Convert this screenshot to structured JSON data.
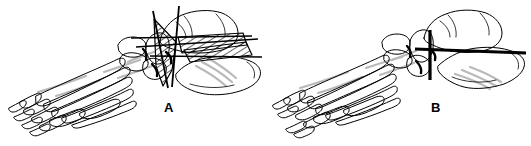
{
  "figure": {
    "background_color": "#ffffff",
    "ink_color": "#000000",
    "shading_color": "#b8b8b8",
    "width": 531,
    "height": 146,
    "type": "anatomical-line-drawing",
    "panels": [
      {
        "id": "A",
        "label": "A",
        "label_x": 170,
        "label_y": 108,
        "description": "foot skeleton with osteotomy guide lines and hatched wedge resection",
        "annotations": {
          "wedge_hatched": true,
          "band_hatched": true,
          "guide_lines": 5
        }
      },
      {
        "id": "B",
        "label": "B",
        "label_x": 437,
        "label_y": 108,
        "description": "foot skeleton with straight osteotomy cut lines, no wedge",
        "annotations": {
          "wedge_hatched": false,
          "band_hatched": false,
          "guide_lines": 2
        }
      }
    ]
  }
}
